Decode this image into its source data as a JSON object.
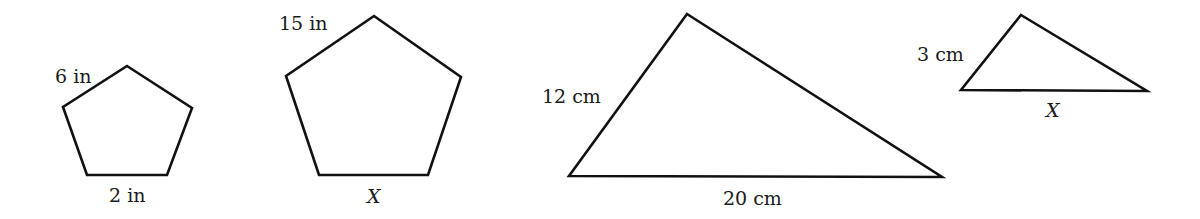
{
  "figures": [
    {
      "id": "small-pentagon",
      "shape": "pentagon",
      "points": "127,66 192,108 167,175 87,175 63,107",
      "labels": [
        {
          "text": "6 in",
          "x": 55,
          "y": 83,
          "italic": false
        },
        {
          "text": "2 in",
          "x": 109,
          "y": 202,
          "italic": false
        }
      ]
    },
    {
      "id": "large-pentagon",
      "shape": "pentagon",
      "points": "374,16 461,77 428,175 319,175 286,76",
      "labels": [
        {
          "text": "15 in",
          "x": 279,
          "y": 30,
          "italic": false
        },
        {
          "text": "X",
          "x": 367,
          "y": 203,
          "italic": true
        }
      ]
    },
    {
      "id": "large-triangle",
      "shape": "triangle",
      "points": "687,14 942,177 569,176",
      "labels": [
        {
          "text": "12 cm",
          "x": 542,
          "y": 103,
          "italic": false
        },
        {
          "text": "20 cm",
          "x": 723,
          "y": 205,
          "italic": false
        }
      ]
    },
    {
      "id": "small-triangle",
      "shape": "triangle",
      "points": "1021,15 1147,91 961,90",
      "labels": [
        {
          "text": "3 cm",
          "x": 917,
          "y": 61,
          "italic": false
        },
        {
          "text": "X",
          "x": 1046,
          "y": 117,
          "italic": true
        }
      ]
    }
  ]
}
